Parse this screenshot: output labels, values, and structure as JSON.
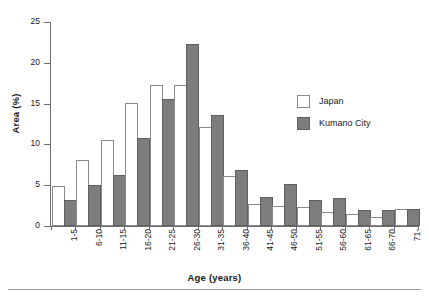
{
  "chart_data": {
    "type": "bar",
    "title": "",
    "xlabel": "Age (years)",
    "ylabel": "Area (%)",
    "ylim": [
      0,
      25
    ],
    "yticks": [
      0,
      5,
      10,
      15,
      20,
      25
    ],
    "grid": false,
    "legend_position": "upper-right",
    "categories": [
      "1-5",
      "6-10",
      "11-15",
      "16-20",
      "21-25",
      "26-30",
      "31-35",
      "36-40",
      "41-45",
      "46-50",
      "51-55",
      "56-60",
      "61-65",
      "66-70",
      "71-"
    ],
    "series": [
      {
        "name": "Japan",
        "color": "#ffffff",
        "values": [
          4.7,
          7.9,
          10.3,
          14.8,
          17.0,
          17.0,
          11.9,
          5.9,
          2.5,
          2.2,
          2.1,
          1.5,
          1.2,
          0.8,
          1.8
        ]
      },
      {
        "name": "Kumano City",
        "color": "#7d7d7d",
        "values": [
          2.9,
          4.8,
          6.0,
          10.5,
          15.3,
          22.1,
          13.4,
          6.6,
          3.3,
          4.9,
          3.0,
          3.2,
          1.7,
          1.7,
          1.8
        ]
      }
    ]
  },
  "legend": {
    "items": [
      {
        "label": "Japan",
        "swatch": "japan"
      },
      {
        "label": "Kumano City",
        "swatch": "kumano"
      }
    ]
  }
}
